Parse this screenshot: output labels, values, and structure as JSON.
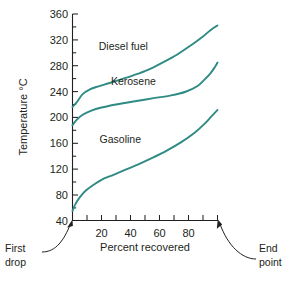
{
  "chart_data": {
    "type": "line",
    "title": "",
    "xlabel": "Percent recovered",
    "ylabel": "Temperature °C",
    "xlim": [
      0,
      100
    ],
    "ylim": [
      20,
      360
    ],
    "grid": false,
    "legend_position": "inline-labels",
    "x_ticks_major": [
      20,
      40,
      60,
      80
    ],
    "x_ticks_minor": [
      0,
      10,
      30,
      50,
      70,
      90,
      100
    ],
    "x_tick_labels": [
      "20",
      "40",
      "60",
      "80"
    ],
    "y_ticks_major": [
      40,
      80,
      120,
      160,
      200,
      240,
      280,
      320,
      360
    ],
    "y_ticks_minor": [
      60,
      100,
      140,
      180,
      220,
      260,
      300,
      340
    ],
    "y_tick_labels": [
      "40",
      "80",
      "120",
      "160",
      "200",
      "240",
      "280",
      "320",
      "360"
    ],
    "series_color": "#2e8b84",
    "series": [
      {
        "name": "Diesel fuel",
        "label_x": 35,
        "label_y": 300,
        "points": [
          {
            "x": 0,
            "y": 207
          },
          {
            "x": 3,
            "y": 215
          },
          {
            "x": 7,
            "y": 228
          },
          {
            "x": 12,
            "y": 236
          },
          {
            "x": 18,
            "y": 241
          },
          {
            "x": 25,
            "y": 246
          },
          {
            "x": 33,
            "y": 252
          },
          {
            "x": 42,
            "y": 259
          },
          {
            "x": 52,
            "y": 268
          },
          {
            "x": 62,
            "y": 280
          },
          {
            "x": 72,
            "y": 293
          },
          {
            "x": 82,
            "y": 309
          },
          {
            "x": 90,
            "y": 323
          },
          {
            "x": 96,
            "y": 335
          },
          {
            "x": 100,
            "y": 341
          }
        ]
      },
      {
        "name": "Kerosene",
        "label_x": 42,
        "label_y": 243,
        "points": [
          {
            "x": 0,
            "y": 177
          },
          {
            "x": 3,
            "y": 186
          },
          {
            "x": 7,
            "y": 194
          },
          {
            "x": 13,
            "y": 201
          },
          {
            "x": 20,
            "y": 206
          },
          {
            "x": 30,
            "y": 211
          },
          {
            "x": 42,
            "y": 216
          },
          {
            "x": 55,
            "y": 221
          },
          {
            "x": 68,
            "y": 226
          },
          {
            "x": 78,
            "y": 232
          },
          {
            "x": 86,
            "y": 241
          },
          {
            "x": 91,
            "y": 252
          },
          {
            "x": 95,
            "y": 262
          },
          {
            "x": 98,
            "y": 272
          },
          {
            "x": 100,
            "y": 280
          }
        ]
      },
      {
        "name": "Gasoline",
        "label_x": 33,
        "label_y": 148,
        "points": [
          {
            "x": 0,
            "y": 36
          },
          {
            "x": 2,
            "y": 47
          },
          {
            "x": 5,
            "y": 58
          },
          {
            "x": 9,
            "y": 69
          },
          {
            "x": 14,
            "y": 78
          },
          {
            "x": 20,
            "y": 87
          },
          {
            "x": 27,
            "y": 94
          },
          {
            "x": 35,
            "y": 102
          },
          {
            "x": 45,
            "y": 112
          },
          {
            "x": 55,
            "y": 123
          },
          {
            "x": 65,
            "y": 135
          },
          {
            "x": 75,
            "y": 149
          },
          {
            "x": 84,
            "y": 164
          },
          {
            "x": 91,
            "y": 179
          },
          {
            "x": 96,
            "y": 192
          },
          {
            "x": 100,
            "y": 202
          }
        ]
      }
    ],
    "annotations": [
      {
        "name": "first-drop",
        "line1": "First",
        "line2": "drop",
        "target_x": 0,
        "side": "left"
      },
      {
        "name": "end-point",
        "line1": "End",
        "line2": "point",
        "target_x": 100,
        "side": "right"
      }
    ]
  }
}
